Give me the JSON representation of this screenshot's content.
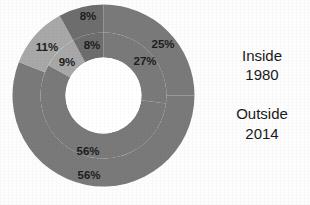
{
  "chart_data": {
    "type": "pie",
    "title": "",
    "subtitle": "",
    "variant": "nested-donut",
    "legend_position": "right",
    "grid": false,
    "colors": {
      "large_slice": "#7a7a7a",
      "light_slice": "#a8a8a8",
      "dark_slice": "#6e6e6e",
      "hole": "#ffffff",
      "label_text": "#1d1d1d",
      "legend_text": "#1a1a1a",
      "background": "#ffffff"
    },
    "rings": [
      {
        "name": "Inside",
        "ring": "inner",
        "year": "1980",
        "labels": [
          "27%",
          "8%",
          "9%",
          "56%"
        ],
        "values": [
          27,
          8,
          9,
          56
        ]
      },
      {
        "name": "Outside",
        "ring": "outer",
        "year": "2014",
        "labels": [
          "25%",
          "8%",
          "11%",
          "56%"
        ],
        "values": [
          25,
          8,
          11,
          56
        ]
      }
    ],
    "slice_labels": {
      "inner_right": "27%",
      "inner_top": "8%",
      "inner_left": "9%",
      "inner_bottom": "56%",
      "outer_right": "25%",
      "outer_top": "8%",
      "outer_left": "11%",
      "outer_bottom": "56%"
    }
  },
  "legend": {
    "groups": [
      {
        "ring_label": "Inside",
        "year_label": "1980"
      },
      {
        "ring_label": "Outside",
        "year_label": "2014"
      }
    ]
  }
}
